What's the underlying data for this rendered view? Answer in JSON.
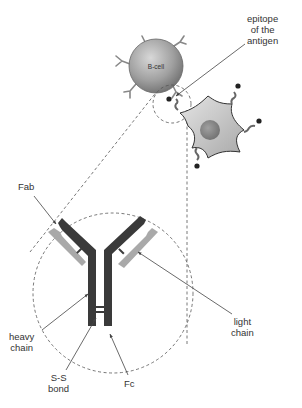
{
  "figure": {
    "type": "diagram"
  },
  "cells": {
    "b_cell": {
      "label": "B-cell",
      "fill": "#9a9a9a"
    },
    "antigen_cell": {
      "fill": "#c8c8c8",
      "nucleus_fill": "#8a8a8a"
    }
  },
  "labels": {
    "epitope": {
      "line1": "epitope",
      "line2": "of the",
      "line3": "antigen"
    },
    "fab": "Fab",
    "heavy_chain": {
      "line1": "heavy",
      "line2": "chain"
    },
    "ss_bond": {
      "line1": "S-S",
      "line2": "bond"
    },
    "fc": "Fc",
    "light_chain": {
      "line1": "light",
      "line2": "chain"
    }
  },
  "colors": {
    "heavy_chain": "#3a3a3a",
    "light_chain": "#a9a9a9",
    "leader_line": "#444444",
    "dashed_outline": "#555555"
  }
}
